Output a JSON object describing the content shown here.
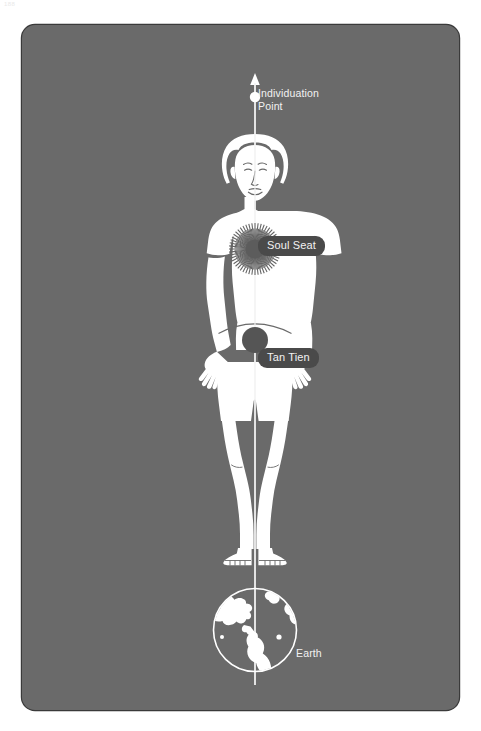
{
  "page": {
    "number": "188"
  },
  "panel": {
    "background_color": "#6a6a6a",
    "border_color": "#3a3a3a",
    "figure_color": "#ffffff",
    "badge_color": "#4a4a4a",
    "label_color": "#f2f2f2"
  },
  "diagram": {
    "title_alt": "Human figure with central vertical channel",
    "labels": {
      "individuation_point": "Individuation\nPoint",
      "soul_seat": "Soul Seat",
      "tan_tien": "Tan Tien",
      "earth": "Earth"
    },
    "markers": [
      {
        "name": "arrow-tip",
        "type": "arrow",
        "x": 233,
        "y": 55
      },
      {
        "name": "individuation-dot",
        "type": "dot",
        "x": 233,
        "y": 72,
        "radius": 5,
        "fill": "#ffffff"
      },
      {
        "name": "soul-seat-burst",
        "type": "sunburst",
        "x": 233,
        "y": 224,
        "radius": 26,
        "fill": "#5a5a5a"
      },
      {
        "name": "tan-tien-dot",
        "type": "dot",
        "x": 233,
        "y": 315,
        "radius": 13,
        "fill": "#555555"
      },
      {
        "name": "earth-globe",
        "type": "globe",
        "x": 233,
        "y": 605,
        "radius": 42,
        "stroke": "#ffffff"
      }
    ],
    "axis_line": {
      "from_y": 55,
      "to_y": 660,
      "x": 233,
      "stroke": "#ffffff",
      "width": 1.4
    }
  }
}
